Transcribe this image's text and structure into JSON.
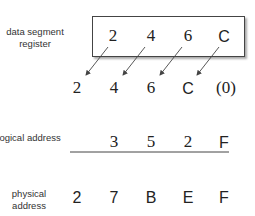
{
  "labels": {
    "register": "data segment register",
    "logical": "logical address",
    "physical": "physical address"
  },
  "register_digits": [
    "2",
    "4",
    "6",
    "C"
  ],
  "shifted_digits": [
    "2",
    "4",
    "6",
    "C",
    "(0)"
  ],
  "logical_digits": [
    "3",
    "5",
    "2",
    "F"
  ],
  "physical_digits": [
    "2",
    "7",
    "B",
    "E",
    "F"
  ],
  "colors": {
    "line": "#444444",
    "text": "#222222",
    "shadow": "#aaaaaa"
  }
}
